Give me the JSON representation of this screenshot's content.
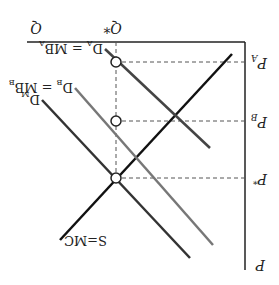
{
  "diagram": {
    "orientation": "rotated-180",
    "axes": {
      "quantity_label": "Q",
      "price_label": "P"
    },
    "equilibrium_quantity_label": "Q*",
    "price_levels": [
      {
        "label": "P_A",
        "main": "P",
        "sub": "A"
      },
      {
        "label": "P_B",
        "main": "P",
        "sub": "B"
      },
      {
        "label": "P*",
        "main": "P",
        "sub": "*"
      }
    ],
    "curves": [
      {
        "id": "supply",
        "label": "S=MC",
        "color": "#111111"
      },
      {
        "id": "demand-a",
        "label": "D_A = MB_A",
        "main": "D",
        "sub": "A",
        "eq": " = MB",
        "sub2": "A",
        "color": "#444444"
      },
      {
        "id": "demand-b",
        "label": "D_B = MB_B",
        "main": "D",
        "sub": "B",
        "eq": " = MB",
        "sub2": "B",
        "color": "#777777"
      },
      {
        "id": "demand-market",
        "label": "D_M",
        "main": "D",
        "sub": "M",
        "color": "#333333"
      }
    ],
    "colors": {
      "axis": "#222222",
      "dashed": "#555555"
    }
  }
}
